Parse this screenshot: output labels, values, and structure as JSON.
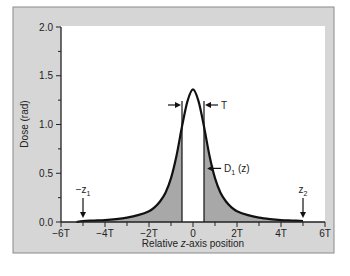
{
  "chart_data": {
    "type": "line",
    "title": "",
    "xlabel_prefix": "Relative ",
    "xlabel_italic": "z",
    "xlabel_suffix": "-axis position",
    "ylabel": "Dose (rad)",
    "xlim": [
      -6,
      6
    ],
    "ylim": [
      0,
      2.0
    ],
    "x_unit": "T",
    "x_ticks": [
      -6,
      -4,
      -2,
      0,
      2,
      4,
      6
    ],
    "x_tick_labels": [
      "−6T",
      "−4T",
      "−2T",
      "0",
      "2T",
      "4T",
      "6T"
    ],
    "x_minor_ticks": [
      -5,
      -3,
      -1,
      1,
      3,
      5
    ],
    "y_ticks": [
      0.0,
      0.5,
      1.0,
      1.5,
      2.0
    ],
    "y_tick_labels": [
      "0.0",
      "0.5",
      "1.0",
      "1.5",
      "2.0"
    ],
    "y_minor_ticks": [
      0.25,
      0.75,
      1.25,
      1.75
    ],
    "series": [
      {
        "name": "D1 (z)",
        "x": [
          -5.3,
          -5,
          -4.5,
          -4,
          -3.5,
          -3,
          -2.5,
          -2,
          -1.75,
          -1.5,
          -1.25,
          -1,
          -0.75,
          -0.5,
          -0.25,
          0,
          0.25,
          0.5,
          0.75,
          1,
          1.25,
          1.5,
          1.75,
          2,
          2.5,
          3,
          3.5,
          4,
          4.5,
          5
        ],
        "y": [
          0.0,
          0.01,
          0.015,
          0.02,
          0.03,
          0.045,
          0.07,
          0.11,
          0.15,
          0.21,
          0.3,
          0.45,
          0.68,
          0.98,
          1.24,
          1.36,
          1.24,
          0.98,
          0.68,
          0.45,
          0.3,
          0.21,
          0.15,
          0.11,
          0.07,
          0.045,
          0.03,
          0.02,
          0.015,
          0.01
        ]
      }
    ],
    "shaded_regions": [
      {
        "from": -5.3,
        "to": -0.5,
        "under": "D1 (z)"
      },
      {
        "from": 0.5,
        "to": 5,
        "under": "D1 (z)"
      }
    ],
    "slice_boundaries": [
      -0.5,
      0.5
    ],
    "annotations": [
      {
        "text": "T",
        "kind": "slice-width",
        "x_range": [
          -0.5,
          0.5
        ],
        "y": 1.2
      },
      {
        "text": "D",
        "sub": "1",
        "suffix": " (z)",
        "kind": "curve-label",
        "x": 0.55,
        "y": 0.55
      },
      {
        "text": "−z",
        "sub": "1",
        "kind": "arrow-down",
        "x": -5,
        "y": 0.0
      },
      {
        "text": "z",
        "sub": "2",
        "kind": "arrow-down",
        "x": 5,
        "y": 0.0
      }
    ],
    "grid": false,
    "legend": "none",
    "colors": {
      "panel": "#d6d6d6",
      "plot_bg": "#ffffff",
      "curve": "#111111",
      "shade": "#a8a8a8"
    }
  }
}
